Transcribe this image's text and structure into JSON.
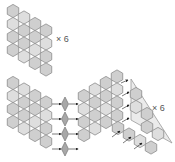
{
  "labels": {
    "top_multiplier": "× 6",
    "bottom_multiplier": "× 6"
  },
  "colors": {
    "hex_fill": "#cfcfcf",
    "hex_fill_light": "#dedede",
    "hex_stroke": "#8c8c8c",
    "diamond_fill": "#a8a8a8",
    "arrow": "#222222",
    "triangle_fill": "#ebebeb",
    "text": "#555555"
  },
  "top_cluster": {
    "hex_radius": 6.6,
    "columns": [
      {
        "x": 13,
        "y0": 11,
        "count": 4
      },
      {
        "x": 24,
        "y0": 17.5,
        "count": 4
      },
      {
        "x": 35,
        "y0": 24,
        "count": 4
      },
      {
        "x": 46,
        "y0": 30.5,
        "count": 4
      }
    ]
  },
  "bottom_left_cluster": {
    "columns": [
      {
        "x": 13,
        "y0": 83,
        "count": 4
      },
      {
        "x": 24,
        "y0": 89.5,
        "count": 4
      },
      {
        "x": 35,
        "y0": 96,
        "count": 4
      },
      {
        "x": 46,
        "y0": 102.5,
        "count": 4
      }
    ]
  },
  "diamonds": {
    "x": 65,
    "ys": [
      104,
      119,
      134,
      149
    ]
  },
  "bottom_mid_cluster": {
    "columns": [
      {
        "x": 84,
        "y0": 96,
        "count": 4
      },
      {
        "x": 95,
        "y0": 89.5,
        "count": 4
      },
      {
        "x": 106,
        "y0": 83,
        "count": 4
      },
      {
        "x": 117,
        "y0": 76.5,
        "count": 4
      }
    ]
  },
  "triangle": {
    "points": "131,79 131,120 172,143",
    "hexes": [
      [
        136,
        94
      ],
      [
        136,
        107
      ],
      [
        147,
        114
      ],
      [
        147,
        127
      ],
      [
        158,
        134
      ],
      [
        118,
        128
      ],
      [
        129,
        134.5
      ],
      [
        140,
        141
      ],
      [
        151,
        147.5
      ]
    ]
  }
}
